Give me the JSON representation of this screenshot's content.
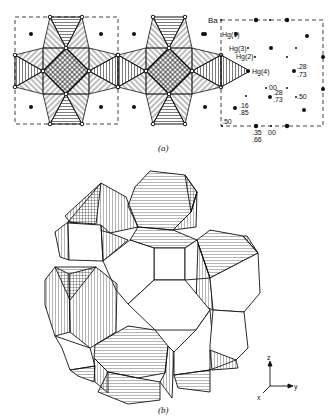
{
  "figure": {
    "panel_a": {
      "caption": "(a)",
      "atom_labels": {
        "ba": "Ba",
        "hg1": "Hg(1)",
        "hg3": "Hg(3)",
        "hg2": "Hg(2)",
        "hg4": "Hg(4)"
      },
      "height_labels": {
        "h_28_73_a_top": ".28",
        "h_28_73_a_bot": ".73",
        "h_00_center": "00",
        "h_28_73_b_top": ".28",
        "h_28_73_b_bot": ".73",
        "h_50_right": ".50",
        "h_16_85_top": ".16",
        "h_16_85_bot": ".85",
        "h_50_corner": ".50",
        "h_35_66_top": ".35",
        "h_35_66_bot": ".66",
        "h_00_bottom": "00"
      }
    },
    "panel_b": {
      "caption": "(b)",
      "axes": {
        "z": "z",
        "y": "y",
        "x": "x"
      }
    }
  }
}
